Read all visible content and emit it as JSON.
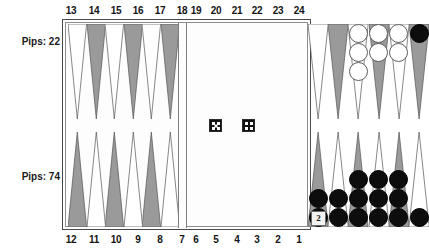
{
  "board": {
    "title": "Backgammon Board",
    "colors": {
      "point_light": "#ffffff",
      "point_dark": "#9a9a9a",
      "point_outline": "#555555",
      "checker_white": "#ffffff",
      "checker_black": "#0d0d0d",
      "frame": "#4a4a4a",
      "background": "#ffffff"
    },
    "pips": {
      "top_label": "Pips: 22",
      "bottom_label": "Pips: 74",
      "top_value": 22,
      "bottom_value": 74
    },
    "point_numbers": {
      "top_left": [
        "13",
        "14",
        "15",
        "16",
        "17",
        "18"
      ],
      "top_right": [
        "19",
        "20",
        "21",
        "22",
        "23",
        "24"
      ],
      "bottom_left": [
        "12",
        "11",
        "10",
        "9",
        "8",
        "7"
      ],
      "bottom_right": [
        "6",
        "5",
        "4",
        "3",
        "2",
        "1"
      ]
    },
    "points": [
      {
        "number": "13",
        "quadrant": "top-left",
        "slot": 0,
        "shade": "light",
        "checkers": 0,
        "color": null
      },
      {
        "number": "14",
        "quadrant": "top-left",
        "slot": 1,
        "shade": "dark",
        "checkers": 0,
        "color": null
      },
      {
        "number": "15",
        "quadrant": "top-left",
        "slot": 2,
        "shade": "light",
        "checkers": 0,
        "color": null
      },
      {
        "number": "16",
        "quadrant": "top-left",
        "slot": 3,
        "shade": "dark",
        "checkers": 0,
        "color": null
      },
      {
        "number": "17",
        "quadrant": "top-left",
        "slot": 4,
        "shade": "light",
        "checkers": 0,
        "color": null
      },
      {
        "number": "18",
        "quadrant": "top-left",
        "slot": 5,
        "shade": "dark",
        "checkers": 0,
        "color": null
      },
      {
        "number": "19",
        "quadrant": "top-right",
        "slot": 0,
        "shade": "light",
        "checkers": 0,
        "color": null
      },
      {
        "number": "20",
        "quadrant": "top-right",
        "slot": 1,
        "shade": "dark",
        "checkers": 0,
        "color": null
      },
      {
        "number": "21",
        "quadrant": "top-right",
        "slot": 2,
        "shade": "light",
        "checkers": 3,
        "color": "white"
      },
      {
        "number": "22",
        "quadrant": "top-right",
        "slot": 3,
        "shade": "dark",
        "checkers": 2,
        "color": "white"
      },
      {
        "number": "23",
        "quadrant": "top-right",
        "slot": 4,
        "shade": "light",
        "checkers": 2,
        "color": "white"
      },
      {
        "number": "24",
        "quadrant": "top-right",
        "slot": 5,
        "shade": "dark",
        "checkers": 1,
        "color": "black"
      },
      {
        "number": "12",
        "quadrant": "bottom-left",
        "slot": 0,
        "shade": "dark",
        "checkers": 0,
        "color": null
      },
      {
        "number": "11",
        "quadrant": "bottom-left",
        "slot": 1,
        "shade": "light",
        "checkers": 0,
        "color": null
      },
      {
        "number": "10",
        "quadrant": "bottom-left",
        "slot": 2,
        "shade": "dark",
        "checkers": 0,
        "color": null
      },
      {
        "number": "9",
        "quadrant": "bottom-left",
        "slot": 3,
        "shade": "light",
        "checkers": 0,
        "color": null
      },
      {
        "number": "8",
        "quadrant": "bottom-left",
        "slot": 4,
        "shade": "dark",
        "checkers": 0,
        "color": null
      },
      {
        "number": "7",
        "quadrant": "bottom-left",
        "slot": 5,
        "shade": "light",
        "checkers": 0,
        "color": null
      },
      {
        "number": "6",
        "quadrant": "bottom-right",
        "slot": 0,
        "shade": "dark",
        "checkers": 2,
        "color": "black"
      },
      {
        "number": "5",
        "quadrant": "bottom-right",
        "slot": 1,
        "shade": "light",
        "checkers": 2,
        "color": "black"
      },
      {
        "number": "4",
        "quadrant": "bottom-right",
        "slot": 2,
        "shade": "dark",
        "checkers": 3,
        "color": "black"
      },
      {
        "number": "3",
        "quadrant": "bottom-right",
        "slot": 3,
        "shade": "light",
        "checkers": 3,
        "color": "black"
      },
      {
        "number": "2",
        "quadrant": "bottom-right",
        "slot": 4,
        "shade": "dark",
        "checkers": 3,
        "color": "black"
      },
      {
        "number": "1",
        "quadrant": "bottom-right",
        "slot": 5,
        "shade": "light",
        "checkers": 1,
        "color": "black"
      }
    ],
    "dice": [
      {
        "value": 5,
        "face": "five"
      },
      {
        "value": 4,
        "face": "four"
      }
    ],
    "doubling_cube": {
      "value": "2"
    }
  }
}
